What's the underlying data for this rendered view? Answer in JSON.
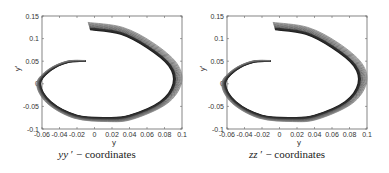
{
  "chart_data": [
    {
      "type": "line",
      "title": "",
      "caption": "yy ′ − coordinates",
      "caption_var": "yy",
      "caption_rest": " ′ −  coordinates",
      "xlabel": "y",
      "ylabel": "y′",
      "xlim": [
        -0.06,
        0.1
      ],
      "ylim": [
        -0.1,
        0.15
      ],
      "xticks": [
        "-0.06",
        "-0.04",
        "-0.02",
        "0",
        "0.02",
        "0.04",
        "0.06",
        "0.08",
        "0.1"
      ],
      "yticks": [
        "0.15",
        "0.1",
        "0.05",
        "0",
        "-0.05",
        "-0.1"
      ],
      "grid": false,
      "description": "Family of nested phase-plane trajectories forming a clockwise spiral from about (-0.005, 0.12) to (-0.01, 0.05)",
      "series": [
        {
          "name": "trajectories",
          "points": [
            [
              -0.005,
              0.12
            ],
            [
              0.03,
              0.11
            ],
            [
              0.06,
              0.08
            ],
            [
              0.085,
              0.04
            ],
            [
              0.09,
              0.0
            ],
            [
              0.075,
              -0.04
            ],
            [
              0.04,
              -0.07
            ],
            [
              0.015,
              -0.075
            ],
            [
              -0.02,
              -0.07
            ],
            [
              -0.05,
              -0.04
            ],
            [
              -0.062,
              0.0
            ],
            [
              -0.05,
              0.03
            ],
            [
              -0.03,
              0.048
            ],
            [
              -0.01,
              0.05
            ]
          ]
        }
      ]
    },
    {
      "type": "line",
      "title": "",
      "caption": "zz ′ − coordinates",
      "caption_var": "zz",
      "caption_rest": " ′ −  coordinates",
      "xlabel": "y",
      "ylabel": "y′",
      "xlim": [
        -0.06,
        0.1
      ],
      "ylim": [
        -0.1,
        0.15
      ],
      "xticks": [
        "-0.06",
        "-0.04",
        "-0.02",
        "0",
        "0.02",
        "0.04",
        "0.06",
        "0.08",
        "0.1"
      ],
      "yticks": [
        "0.15",
        "0.1",
        "0.05",
        "0",
        "-0.05",
        "-0.1"
      ],
      "grid": false,
      "description": "Family of nested phase-plane trajectories forming a clockwise spiral from about (-0.005, 0.12) to (-0.01, 0.05)",
      "series": [
        {
          "name": "trajectories",
          "points": [
            [
              -0.005,
              0.12
            ],
            [
              0.03,
              0.11
            ],
            [
              0.06,
              0.08
            ],
            [
              0.085,
              0.04
            ],
            [
              0.09,
              0.0
            ],
            [
              0.075,
              -0.04
            ],
            [
              0.04,
              -0.07
            ],
            [
              0.015,
              -0.075
            ],
            [
              -0.02,
              -0.07
            ],
            [
              -0.05,
              -0.04
            ],
            [
              -0.062,
              0.0
            ],
            [
              -0.05,
              0.03
            ],
            [
              -0.03,
              0.048
            ],
            [
              -0.01,
              0.05
            ]
          ]
        }
      ]
    }
  ]
}
